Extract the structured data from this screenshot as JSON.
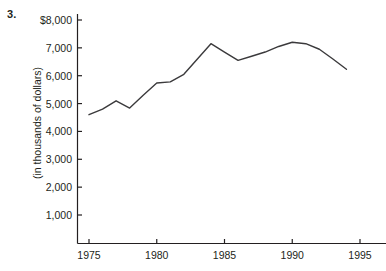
{
  "question_number": "3.",
  "y_axis_title": "(in thousands of dollars)",
  "ticks": {
    "y_labels": [
      "$8,000",
      "7,000",
      "6,000",
      "5,000",
      "4,000",
      "3,000",
      "2,000",
      "1,000"
    ],
    "x_labels": [
      "1975",
      "1980",
      "1985",
      "1990",
      "1995"
    ]
  },
  "colors": {
    "axis": "#231f20",
    "line": "#3b3a3c",
    "background": "#ffffff",
    "text": "#231f20"
  },
  "chart_data": {
    "type": "line",
    "title": "",
    "subtitle": "",
    "xlabel": "",
    "ylabel": "(in thousands of dollars)",
    "xlim": [
      1974,
      1996
    ],
    "ylim": [
      0,
      8000
    ],
    "grid": false,
    "legend": "none",
    "x_tick_values": [
      1975,
      1980,
      1985,
      1990,
      1995
    ],
    "y_tick_values": [
      1000,
      2000,
      3000,
      4000,
      5000,
      6000,
      7000,
      8000
    ],
    "y_tick_labels": [
      "1,000",
      "2,000",
      "3,000",
      "4,000",
      "5,000",
      "6,000",
      "7,000",
      "$8,000"
    ],
    "x": [
      1975,
      1976,
      1977,
      1978,
      1979,
      1980,
      1981,
      1982,
      1983,
      1984,
      1985,
      1986,
      1987,
      1988,
      1989,
      1990,
      1991,
      1992,
      1993,
      1994
    ],
    "values": [
      4600,
      4800,
      5100,
      4840,
      5300,
      5740,
      5780,
      6050,
      6600,
      7150,
      6850,
      6550,
      6700,
      6850,
      7050,
      7200,
      7150,
      6950,
      6600,
      6230
    ],
    "series": [
      {
        "name": "amount",
        "values": [
          4600,
          4800,
          5100,
          4840,
          5300,
          5740,
          5780,
          6050,
          6600,
          7150,
          6850,
          6550,
          6700,
          6850,
          7050,
          7200,
          7150,
          6950,
          6600,
          6230
        ]
      }
    ]
  }
}
